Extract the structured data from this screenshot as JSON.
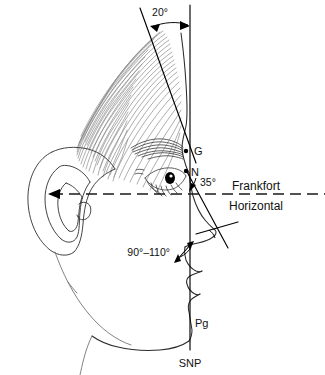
{
  "figure": {
    "ink_color": "#000000",
    "hair_color": "#8a8a8a"
  },
  "reference_lines": {
    "vertical": {
      "name": "SNP true vertical line",
      "label": "SNP"
    },
    "horizontal": {
      "name": "Frankfort horizontal plane",
      "label_line1": "Frankfort",
      "label_line2": "Horizontal"
    }
  },
  "landmarks": [
    {
      "id": "G",
      "label": "G",
      "name": "glabella"
    },
    {
      "id": "N",
      "label": "N",
      "name": "nasion"
    },
    {
      "id": "Pg",
      "label": "Pg",
      "name": "pogonion"
    }
  ],
  "angles": [
    {
      "id": "forehead",
      "label": "20°",
      "name": "forehead inclination angle"
    },
    {
      "id": "nasofrontal",
      "label": "35°",
      "name": "nasal dorsum angle at nasion"
    },
    {
      "id": "nasolabial",
      "label": "90°–110°",
      "name": "nasolabial angle"
    }
  ]
}
